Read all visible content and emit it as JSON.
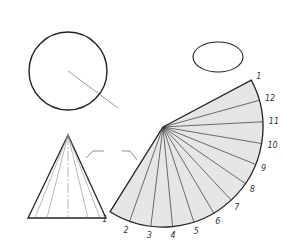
{
  "colors": {
    "line": "#222222",
    "thin": "#666666",
    "fill": "#e6e6e6",
    "background": "#ffffff"
  },
  "top_view": {
    "center_label": "O",
    "fl_label": "FL",
    "dimension_label": "A",
    "point_labels": [
      "1",
      "2",
      "3",
      "4",
      "5",
      "6",
      "7",
      "8",
      "9",
      "10",
      "11",
      "12"
    ]
  },
  "pictorial": {
    "apex_label": "O",
    "point_labels": [
      "1",
      "2",
      "3",
      "4",
      "5",
      "6",
      "7",
      "8",
      "9",
      "10",
      "11",
      "12"
    ]
  },
  "front_view": {
    "apex_label": "O",
    "tl_label": "TL",
    "base_labels": [
      "4",
      "3",
      "2",
      "1",
      "12",
      "11",
      "10"
    ]
  },
  "pattern": {
    "apex_label": "O",
    "dimension_label": "A",
    "point_labels": [
      "1",
      "2",
      "3",
      "4",
      "5",
      "6",
      "7",
      "8",
      "9",
      "10",
      "11",
      "12",
      "1"
    ]
  }
}
